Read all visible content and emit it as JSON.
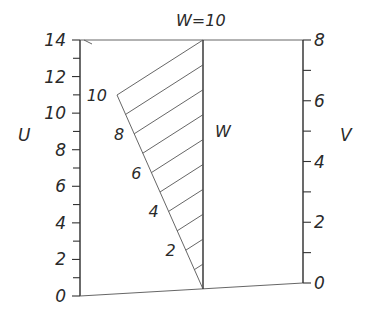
{
  "diagram": {
    "type": "alignment-nomogram",
    "top_label": "W=10",
    "axes": {
      "U": {
        "label": "U",
        "min": 0,
        "max": 14,
        "major_labels": [
          "0",
          "2",
          "4",
          "6",
          "8",
          "10",
          "12",
          "14"
        ],
        "minor_step": 1
      },
      "W": {
        "label": "W",
        "min": 0,
        "max": 10
      },
      "W_diag": {
        "labels": [
          "2",
          "4",
          "6",
          "8",
          "10"
        ]
      },
      "V": {
        "label": "V",
        "min": 0,
        "max": 8,
        "major_labels": [
          "0",
          "2",
          "4",
          "6",
          "8"
        ],
        "minor_step": 1
      }
    },
    "colors": {
      "ink": "#2b2b2b",
      "background": "#ffffff"
    }
  }
}
